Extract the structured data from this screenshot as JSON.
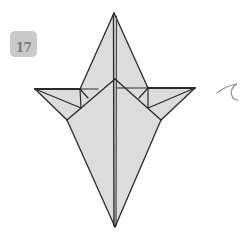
{
  "step": {
    "number": "17"
  },
  "diagram": {
    "paper_fill": "#dcdcdc",
    "line_color": "#2a2a2a",
    "arrow_color": "#8a8a8a",
    "shape_points": {
      "top_tip": [
        114,
        13
      ],
      "bottom_tip": [
        115,
        227
      ],
      "left_wing_tip": [
        35,
        89
      ],
      "right_wing_tip": [
        195,
        88
      ],
      "left_shoulder": [
        67,
        120
      ],
      "right_shoulder": [
        161,
        120
      ],
      "center_meet": [
        115,
        79
      ]
    },
    "arrow": {
      "type": "curl-turn-over-arrow"
    }
  }
}
